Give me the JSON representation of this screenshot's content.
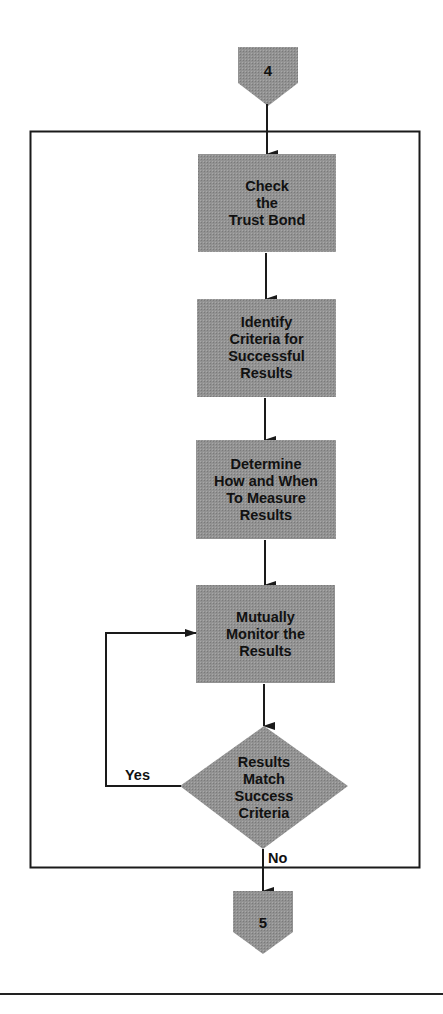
{
  "header_fragment": {
    "left": "—",
    "middle": "———————",
    "right": "—————————————"
  },
  "colors": {
    "node_fill": "#8e8e8e",
    "stroke": "#1a1a1a",
    "background": "#ffffff"
  },
  "connectors": {
    "entry": {
      "label": "4"
    },
    "exit": {
      "label": "5"
    }
  },
  "steps": [
    {
      "label": "Check\nthe\nTrust Bond"
    },
    {
      "label": "Identify\nCriteria for\nSuccessful\nResults"
    },
    {
      "label": "Determine\nHow and When\nTo Measure\nResults"
    },
    {
      "label": "Mutually\nMonitor the\nResults"
    }
  ],
  "decision": {
    "label": "Results\nMatch\nSuccess\nCriteria",
    "yes_label": "Yes",
    "no_label": "No"
  }
}
